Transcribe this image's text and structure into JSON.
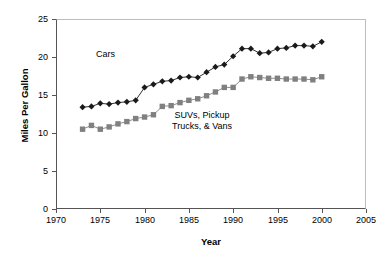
{
  "chart_data": {
    "type": "line",
    "title": "",
    "subtitle": "",
    "xlabel": "Year",
    "ylabel": "Miles Per Gallon",
    "xlim": [
      1970,
      2005
    ],
    "ylim": [
      0,
      25
    ],
    "xticks": [
      1970,
      1975,
      1980,
      1985,
      1990,
      1995,
      2000,
      2005
    ],
    "yticks": [
      0,
      5,
      10,
      15,
      20,
      25
    ],
    "grid": false,
    "legend": "in-plot annotations",
    "x": [
      1973,
      1974,
      1975,
      1976,
      1977,
      1978,
      1979,
      1980,
      1981,
      1982,
      1983,
      1984,
      1985,
      1986,
      1987,
      1988,
      1989,
      1990,
      1991,
      1992,
      1993,
      1994,
      1995,
      1996,
      1997,
      1998,
      1999,
      2000
    ],
    "series": [
      {
        "name": "Cars",
        "marker": "diamond",
        "color": "#1a1a1a",
        "values": [
          13.4,
          13.5,
          13.9,
          13.8,
          14.0,
          14.1,
          14.3,
          16.0,
          16.4,
          16.8,
          16.9,
          17.3,
          17.4,
          17.3,
          18.0,
          18.7,
          19.0,
          20.1,
          21.1,
          21.1,
          20.5,
          20.6,
          21.1,
          21.2,
          21.5,
          21.5,
          21.4,
          22.0
        ]
      },
      {
        "name": "SUVs, Pickup Trucks, & Vans",
        "marker": "square",
        "color": "#808080",
        "values": [
          10.5,
          11.0,
          10.5,
          10.8,
          11.2,
          11.5,
          11.9,
          12.1,
          12.4,
          13.5,
          13.6,
          14.0,
          14.3,
          14.5,
          14.9,
          15.4,
          16.0,
          16.0,
          17.1,
          17.4,
          17.3,
          17.2,
          17.2,
          17.1,
          17.1,
          17.1,
          17.0,
          17.4
        ]
      }
    ],
    "annotations": [
      {
        "text": "Cars",
        "x": 1980,
        "y": 20.2
      },
      {
        "text_line1": "SUVs, Pickup",
        "text_line2": "Trucks, & Vans",
        "x": 1989,
        "y": 12.3
      }
    ]
  },
  "axes": {
    "ytick_labels": [
      "25",
      "20",
      "15",
      "10",
      "5",
      "0"
    ],
    "xtick_labels": [
      "1970",
      "1975",
      "1980",
      "1985",
      "1990",
      "1995",
      "2000",
      "2005"
    ],
    "ylabel": "Miles Per Gallon",
    "xlabel": "Year"
  },
  "annotations": {
    "cars": "Cars",
    "suv_line1": "SUVs, Pickup",
    "suv_line2": "Trucks, & Vans"
  },
  "colors": {
    "cars": "#1a1a1a",
    "trucks": "#808080",
    "axis": "#555555",
    "frame": "#bdbdbd",
    "background": "#ffffff"
  }
}
